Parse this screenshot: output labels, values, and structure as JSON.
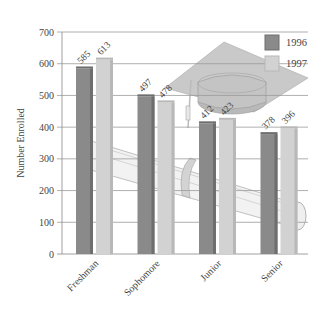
{
  "chart_data": {
    "type": "bar",
    "title": "",
    "xlabel": "",
    "ylabel": "Number Enrolled",
    "ylim": [
      0,
      700
    ],
    "yticks": [
      0,
      100,
      200,
      300,
      400,
      500,
      600,
      700
    ],
    "grid": true,
    "legend_position": "top-right",
    "categories": [
      "Freshman",
      "Sophomore",
      "Junior",
      "Senior"
    ],
    "series": [
      {
        "name": "1996",
        "values": [
          585,
          497,
          412,
          378
        ],
        "color": "#8a8a8a"
      },
      {
        "name": "1997",
        "values": [
          613,
          478,
          423,
          396
        ],
        "color": "#d0d0d0"
      }
    ],
    "background_illustration": "graduation cap and diploma scroll"
  },
  "colors": {
    "series_1996": "#8a8a8a",
    "series_1996_dark": "#6e6e6e",
    "series_1997": "#d2d2d2",
    "series_1997_dark": "#b8b8b8",
    "grid": "#9a9a9a",
    "axis": "#888888",
    "text": "#444444"
  }
}
